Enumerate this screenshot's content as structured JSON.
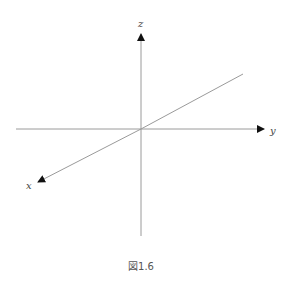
{
  "figure": {
    "caption": "図1.6",
    "axes": {
      "z": {
        "label": "z"
      },
      "y": {
        "label": "y"
      },
      "x": {
        "label": "x"
      }
    },
    "colors": {
      "line": "#9a9a9a",
      "arrow": "#111111",
      "label": "#444444"
    }
  }
}
